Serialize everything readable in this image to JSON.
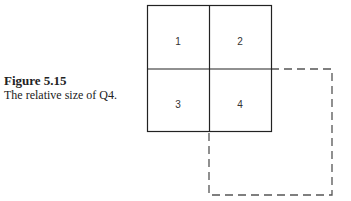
{
  "caption": {
    "title": "Figure 5.15",
    "text": "The relative size of Q4."
  },
  "diagram": {
    "quadrants": [
      {
        "label": "1",
        "x": 178,
        "y": 41
      },
      {
        "label": "2",
        "x": 240,
        "y": 41
      },
      {
        "label": "3",
        "x": 178,
        "y": 105
      },
      {
        "label": "4",
        "x": 240,
        "y": 105
      }
    ],
    "colors": {
      "stroke": "#222222",
      "dashed_stroke": "#555555"
    }
  }
}
